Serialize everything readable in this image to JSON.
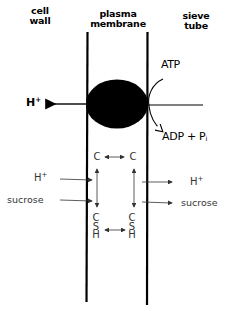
{
  "labels": {
    "cell_wall": [
      "cell",
      "wall"
    ],
    "plasma_membrane": [
      "plasma",
      "membrane"
    ],
    "sieve_tube": [
      "sieve",
      "tube"
    ]
  },
  "pump": {
    "h_out": "H",
    "h_out_sup": "+",
    "atp": "ATP",
    "adp": "ADP + P",
    "adp_sub": "i"
  },
  "transport": {
    "left_in": [
      {
        "label": "H",
        "sup": "+"
      },
      {
        "label": "sucrose"
      }
    ],
    "right_out": [
      {
        "label": "H",
        "sup": "+"
      },
      {
        "label": "sucrose"
      }
    ]
  },
  "carrier": {
    "top_left": "C",
    "top_right": "C",
    "bottom_left": [
      "C",
      "S",
      "H"
    ],
    "bottom_right": [
      "C",
      "S",
      "H"
    ]
  },
  "colors": {
    "line": "#000000",
    "thin_line": "#333333",
    "background": "#ffffff"
  }
}
